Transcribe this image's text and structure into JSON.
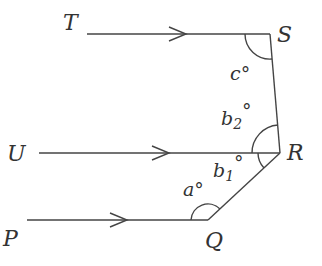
{
  "diagram": {
    "points": {
      "T": {
        "label": "T"
      },
      "S": {
        "label": "S"
      },
      "U": {
        "label": "U"
      },
      "R": {
        "label": "R"
      },
      "P": {
        "label": "P"
      },
      "Q": {
        "label": "Q"
      }
    },
    "angles": {
      "c": "c°",
      "b2_base": "b",
      "b2_sub": "2",
      "b1_base": "b",
      "b1_sub": "1",
      "a": "a°",
      "deg": "°"
    },
    "colors": {
      "line": "#444444",
      "text": "#333333"
    }
  }
}
